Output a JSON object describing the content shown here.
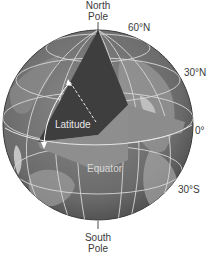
{
  "labels": {
    "north_pole_line1": "North",
    "north_pole_line2": "Pole",
    "south_pole_line1": "South",
    "south_pole_line2": "Pole",
    "lat_60n": "60°N",
    "lat_30n": "30°N",
    "lat_0": "0°",
    "lat_30s": "30°S",
    "latitude": "Latitude",
    "equator": "Equator"
  },
  "colors": {
    "globe_base": "#6e6e6e",
    "globe_land": "#8c8c8c",
    "latitude_wedge": "#3d3d3d",
    "equator_plane": "#8a8a8a",
    "axis_plane": "#7a7a7a",
    "grid_lines": "#d8d8d8",
    "label_text": "#3a3a3a"
  }
}
